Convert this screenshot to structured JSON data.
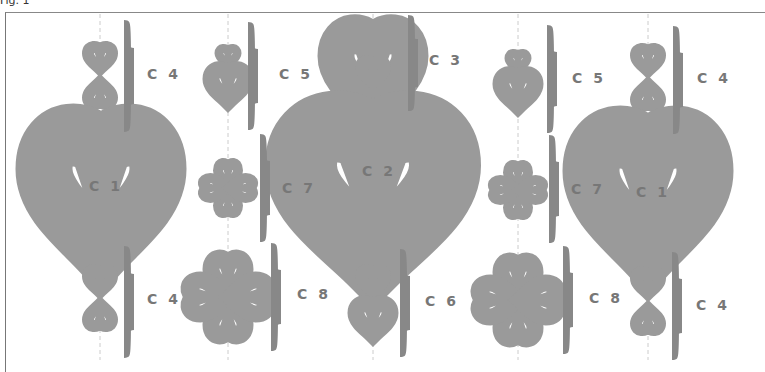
{
  "figure": {
    "label": "Fig. 1"
  },
  "guide_lines_x": [
    100,
    228,
    373,
    518,
    648
  ],
  "labels": [
    {
      "id": "c4-top-left",
      "text": "C 4",
      "x": 147,
      "y": 74
    },
    {
      "id": "c5-left",
      "text": "C 5",
      "x": 279,
      "y": 74
    },
    {
      "id": "c3",
      "text": "C 3",
      "x": 429,
      "y": 60
    },
    {
      "id": "c5-right",
      "text": "C 5",
      "x": 572,
      "y": 74
    },
    {
      "id": "c4-top-right",
      "text": "C 4",
      "x": 697,
      "y": 74
    },
    {
      "id": "c1-left",
      "text": "C 1",
      "x": 89,
      "y": 178
    },
    {
      "id": "c7-left",
      "text": "C 7",
      "x": 280,
      "y": 185
    },
    {
      "id": "c2",
      "text": "C 2",
      "x": 362,
      "y": 167
    },
    {
      "id": "c7-right",
      "text": "C 7",
      "x": 572,
      "y": 187
    },
    {
      "id": "c1-right",
      "text": "C 1",
      "x": 633,
      "y": 184
    },
    {
      "id": "c4-bottom-left",
      "text": "C 4",
      "x": 147,
      "y": 298
    },
    {
      "id": "c8-left",
      "text": "C 8",
      "x": 295,
      "y": 292
    },
    {
      "id": "c6",
      "text": "C 6",
      "x": 424,
      "y": 299
    },
    {
      "id": "c8-right",
      "text": "C 8",
      "x": 589,
      "y": 298
    },
    {
      "id": "c4-bottom-right",
      "text": "C 4",
      "x": 697,
      "y": 305
    }
  ],
  "colors": {
    "stroke": "#9a9a9a",
    "brace": "#888888",
    "guide": "#cccccc",
    "text": "#777777"
  }
}
